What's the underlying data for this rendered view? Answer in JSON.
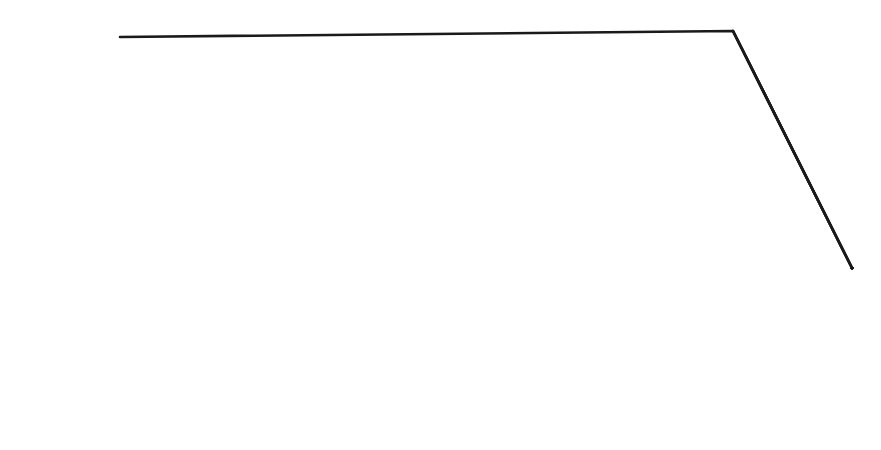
{
  "diagram": {
    "type": "jigsaw-puzzle",
    "pieces": [
      {
        "id": "A1",
        "code": "A1",
        "label": "Quality reduction",
        "line1": "Quality",
        "line2": "reduction"
      },
      {
        "id": "A2",
        "code": "A2",
        "label": "Instability",
        "line1": "Instability"
      },
      {
        "id": "A3",
        "code": "A3",
        "label": "Dilution of business advantage",
        "line1": "Dilution of",
        "line2": "business advantage"
      },
      {
        "id": "D1",
        "code": "D1",
        "label": "Aggro and distrust",
        "line1": "Aggro and",
        "line2": "distrust"
      },
      {
        "id": "D2",
        "code": "D2",
        "label": "Delays",
        "line1": "Delays"
      },
      {
        "id": "D3",
        "code": "D3",
        "label": "Re-work",
        "line1": "Re-work"
      },
      {
        "id": "B1",
        "code": "B1",
        "label": "Waste",
        "line1": "Waste"
      },
      {
        "id": "B2",
        "code": "B2",
        "label": "IS islands",
        "line1": "IS islands"
      },
      {
        "id": "B3",
        "code": "B3",
        "label": "Relevance lost",
        "line1": "Relevance lost"
      }
    ],
    "base_columns": [
      {
        "label": "Knowledge"
      },
      {
        "label": "Foundation"
      },
      {
        "label": "Timing"
      }
    ],
    "colors": {
      "line": "#1a1a1a",
      "background": "#ffffff"
    }
  }
}
